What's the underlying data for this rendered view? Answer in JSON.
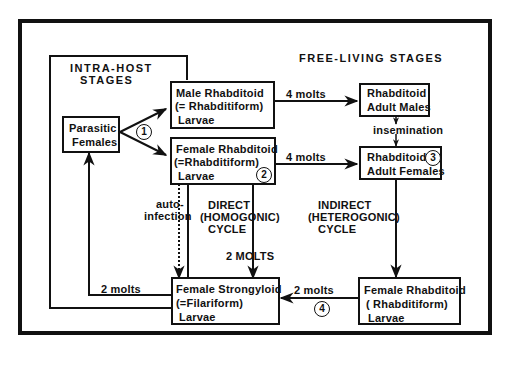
{
  "diagram": {
    "title_free_living": "FREE-LIVING STAGES",
    "title_intra_host_line1": "INTRA-HOST",
    "title_intra_host_line2": "STAGES",
    "nodes": {
      "parasitic_females": {
        "line1": "Parasitic",
        "line2": "Females"
      },
      "male_rhabditoid_larvae": {
        "line1": "Male Rhabditoid",
        "line2": "(= Rhabditiform)",
        "line3": "Larvae"
      },
      "female_rhabditoid_larvae": {
        "line1": "Female Rhabditoid",
        "line2": "(=Rhabditiform)",
        "line3": "Larvae",
        "badge": "2"
      },
      "rhabditoid_adult_males": {
        "line1": "Rhabditoid",
        "line2": "Adult Males"
      },
      "rhabditoid_adult_females": {
        "line1": "Rhabditoid",
        "line2": "Adult Females",
        "badge": "3"
      },
      "female_strongyloid_larvae": {
        "line1": "Female Strongyloid",
        "line2": "(=Filariform)",
        "line3": "Larvae"
      },
      "female_rhabditoid_free_larvae": {
        "line1": "Female Rhabditoid",
        "line2": "( Rhabditiform)",
        "line3": "Larvae"
      }
    },
    "edges": {
      "male_4_molts": "4 molts",
      "female_4_molts": "4 molts",
      "insemination": "insemination",
      "parasitic_badge": "1",
      "auto_infection_line1": "auto-",
      "auto_infection_line2": "infection",
      "direct_line1": "DIRECT",
      "direct_line2": "(HOMOGONIC)",
      "direct_line3": "CYCLE",
      "direct_molts": "2 MOLTS",
      "indirect_line1": "INDIRECT",
      "indirect_line2": "(HETEROGONIC)",
      "indirect_line3": "CYCLE",
      "strongyloid_to_parasitic_molts": "2 molts",
      "rhabditoid_to_strongyloid_molts": "2 molts",
      "rhabditoid_to_strongyloid_badge": "4"
    }
  }
}
